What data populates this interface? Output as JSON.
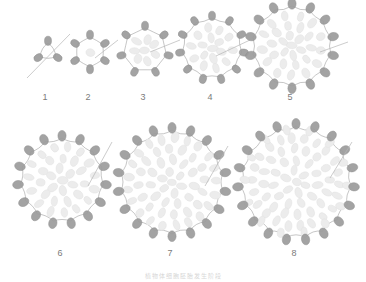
{
  "figure": {
    "title": "",
    "caption": "植物体细胞胚胎发生阶段",
    "background_color": "#ffffff",
    "peripheral_cell_color": "#9c9c9c",
    "peripheral_cell_stroke": "#8a8a8a",
    "inner_cell_color": "#ececec",
    "inner_cell_stroke": "#e2e2e2",
    "outline_color": "#8f8f8f",
    "leader_line_color": "#b6b6b6",
    "label_color": "#7b7b7b",
    "row_labels_top": [
      "1",
      "2",
      "3",
      "4",
      "5"
    ],
    "row_labels_bottom": [
      "6",
      "7",
      "8"
    ]
  },
  "chart_data": {
    "type": "diagram",
    "title": "植物体细胞胚胎发生阶段",
    "xlabel": "",
    "ylabel": "",
    "grid": false,
    "legend": "none",
    "categories": [
      "1",
      "2",
      "3",
      "4",
      "5",
      "6",
      "7",
      "8"
    ],
    "values": [
      3,
      6,
      7,
      11,
      14,
      15,
      18,
      19
    ],
    "series": [
      {
        "name": "peripheral_cells",
        "values": [
          3,
          6,
          7,
          11,
          14,
          15,
          18,
          19
        ]
      },
      {
        "name": "inner_cells",
        "values": [
          0,
          1,
          7,
          13,
          27,
          33,
          55,
          61
        ]
      },
      {
        "name": "radius_px",
        "values": [
          9,
          15,
          22,
          30,
          40,
          42,
          52,
          56
        ]
      }
    ],
    "stages": [
      {
        "label": "1",
        "cx": 48,
        "cy": 52,
        "radius": 9,
        "peripheral": 3,
        "inner_rings": [],
        "label_x": 45,
        "label_y": 100,
        "leader": {
          "x1": 27,
          "y1": 78,
          "x2": 70,
          "y2": 34
        }
      },
      {
        "label": "2",
        "cx": 90,
        "cy": 52,
        "radius": 15,
        "peripheral": 6,
        "inner_rings": [
          [
            0,
            1
          ]
        ],
        "label_x": 88,
        "label_y": 100,
        "leader": {
          "x1": 95,
          "y1": 58,
          "x2": 118,
          "y2": 40
        }
      },
      {
        "label": "3",
        "cx": 145,
        "cy": 50,
        "radius": 22,
        "peripheral": 7,
        "inner_rings": [
          [
            0,
            1
          ],
          [
            11,
            7
          ]
        ],
        "label_x": 143,
        "label_y": 100,
        "leader": {
          "x1": 150,
          "y1": 52,
          "x2": 180,
          "y2": 40
        }
      },
      {
        "label": "4",
        "cx": 212,
        "cy": 48,
        "radius": 30,
        "peripheral": 11,
        "inner_rings": [
          [
            0,
            1
          ],
          [
            10,
            6
          ],
          [
            20,
            10
          ]
        ],
        "label_x": 210,
        "label_y": 100,
        "leader": {
          "x1": 216,
          "y1": 56,
          "x2": 250,
          "y2": 40
        }
      },
      {
        "label": "5",
        "cx": 292,
        "cy": 46,
        "radius": 40,
        "peripheral": 14,
        "inner_rings": [
          [
            0,
            1
          ],
          [
            10,
            6
          ],
          [
            20,
            10
          ],
          [
            30,
            13
          ]
        ],
        "label_x": 290,
        "label_y": 100,
        "leader": {
          "x1": 320,
          "y1": 52,
          "x2": 348,
          "y2": 42
        }
      },
      {
        "label": "6",
        "cx": 62,
        "cy": 180,
        "radius": 42,
        "peripheral": 15,
        "inner_rings": [
          [
            0,
            1
          ],
          [
            11,
            6
          ],
          [
            22,
            11
          ],
          [
            33,
            15
          ]
        ],
        "label_x": 60,
        "label_y": 256,
        "leader": {
          "x1": 88,
          "y1": 186,
          "x2": 112,
          "y2": 142
        }
      },
      {
        "label": "7",
        "cx": 172,
        "cy": 182,
        "radius": 52,
        "peripheral": 18,
        "inner_rings": [
          [
            0,
            1
          ],
          [
            11,
            6
          ],
          [
            22,
            11
          ],
          [
            33,
            16
          ],
          [
            44,
            21
          ]
        ],
        "label_x": 170,
        "label_y": 256,
        "leader": {
          "x1": 205,
          "y1": 186,
          "x2": 228,
          "y2": 146
        }
      },
      {
        "label": "8",
        "cx": 296,
        "cy": 182,
        "radius": 56,
        "peripheral": 19,
        "inner_rings": [
          [
            0,
            1
          ],
          [
            11,
            6
          ],
          [
            22,
            11
          ],
          [
            33,
            16
          ],
          [
            44,
            22
          ],
          [
            52,
            14
          ]
        ],
        "label_x": 294,
        "label_y": 256,
        "leader": {
          "x1": 330,
          "y1": 178,
          "x2": 352,
          "y2": 142
        }
      }
    ]
  }
}
